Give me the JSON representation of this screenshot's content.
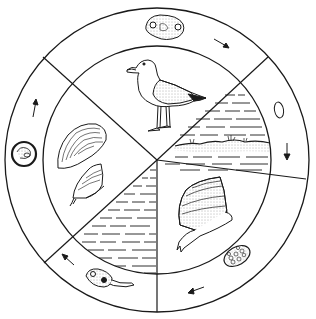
{
  "diagram": {
    "type": "life-cycle",
    "direction": "clockwise",
    "colors": {
      "ink": "#1a1a1a",
      "background": "#ffffff",
      "stipple": "#555555"
    },
    "geometry": {
      "center": [
        157,
        160
      ],
      "outer_radius": 152,
      "inner_radius": 114
    },
    "inner_sectors": [
      {
        "id": "host-gull",
        "icon": "gull-icon",
        "habitat": "land"
      },
      {
        "id": "habitat-shore-water",
        "icon": "water-shore-icon",
        "habitat": "shoreline water"
      },
      {
        "id": "host-snail-large",
        "icon": "snail-icon",
        "habitat": "land"
      },
      {
        "id": "habitat-water",
        "icon": "water-icon",
        "habitat": "water"
      },
      {
        "id": "host-mussel-periwinkle",
        "icon": "mussel-icon",
        "habitat": "land"
      }
    ],
    "outer_ring_stages": [
      {
        "id": "stage-adult-worm",
        "icon": "adult-worm-icon",
        "arrow": "arrow-right-down"
      },
      {
        "id": "stage-egg",
        "icon": "egg-icon",
        "arrow": "arrow-down"
      },
      {
        "id": "stage-sporocyst",
        "icon": "sporocyst-icon",
        "arrow": "arrow-left"
      },
      {
        "id": "stage-cercaria",
        "icon": "cercaria-icon",
        "arrow": "arrow-up-left"
      },
      {
        "id": "stage-metacercaria-cyst",
        "icon": "cyst-icon",
        "arrow": "arrow-up"
      }
    ]
  }
}
